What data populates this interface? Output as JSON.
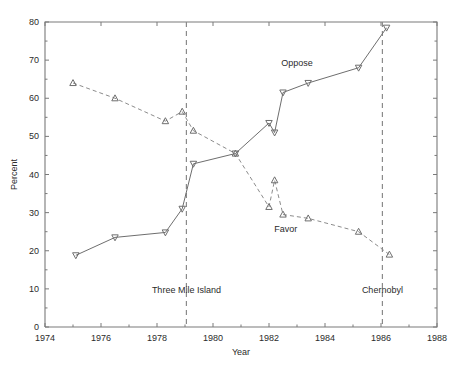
{
  "chart_data": {
    "type": "line",
    "title": "",
    "subtitle": "",
    "xlabel": "Year",
    "ylabel": "Percent",
    "xlim": [
      1974,
      1988
    ],
    "ylim": [
      0,
      80
    ],
    "grid": false,
    "legend_position": "inline-annotations",
    "x_ticks": [
      1974,
      1976,
      1978,
      1980,
      1982,
      1984,
      1986,
      1988
    ],
    "x_tick_labels": [
      "1974",
      "1976",
      "1978",
      "1980",
      "1982",
      "1984",
      "1986",
      "1988"
    ],
    "x_minor_ticks": [
      1975,
      1977,
      1979,
      1981,
      1983,
      1985,
      1987
    ],
    "y_ticks": [
      0,
      10,
      20,
      30,
      40,
      50,
      60,
      70,
      80
    ],
    "y_tick_labels": [
      "0",
      "10",
      "20",
      "30",
      "40",
      "50",
      "60",
      "70",
      "80"
    ],
    "series": [
      {
        "name": "Favor",
        "style": "dashed",
        "marker": "triangle-up",
        "label_text": "Favor",
        "label_x": 1982.6,
        "label_y": 25.0,
        "x": [
          1975.0,
          1976.5,
          1978.3,
          1978.9,
          1979.3,
          1980.8,
          1982.0,
          1982.2,
          1982.5,
          1983.4,
          1985.2,
          1986.3
        ],
        "y": [
          64.0,
          60.0,
          54.0,
          56.5,
          51.5,
          45.5,
          31.5,
          38.5,
          29.5,
          28.5,
          25.0,
          19.0
        ]
      },
      {
        "name": "Oppose",
        "style": "solid",
        "marker": "triangle-down",
        "label_text": "Oppose",
        "label_x": 1983.0,
        "label_y": 68.5,
        "x": [
          1975.1,
          1976.5,
          1978.3,
          1978.9,
          1979.3,
          1980.8,
          1982.0,
          1982.2,
          1982.5,
          1983.4,
          1985.2,
          1986.2
        ],
        "y": [
          18.8,
          23.5,
          24.8,
          31.0,
          42.8,
          45.5,
          53.5,
          51.0,
          61.5,
          64.0,
          68.0,
          78.5
        ]
      }
    ],
    "annotations": [
      {
        "text": "Three Mile Island",
        "x": 1979.05,
        "label_y": 9.0,
        "type": "vline"
      },
      {
        "text": "Chernobyl",
        "x": 1986.05,
        "label_y": 9.0,
        "type": "vline"
      }
    ],
    "colors": {
      "axis": "#7a7a7a",
      "series_solid": "#6e6e6e",
      "series_dashed": "#8c8c8c",
      "event_line": "#8a8a8a",
      "text": "#2b2b2b",
      "background": "#ffffff"
    }
  }
}
